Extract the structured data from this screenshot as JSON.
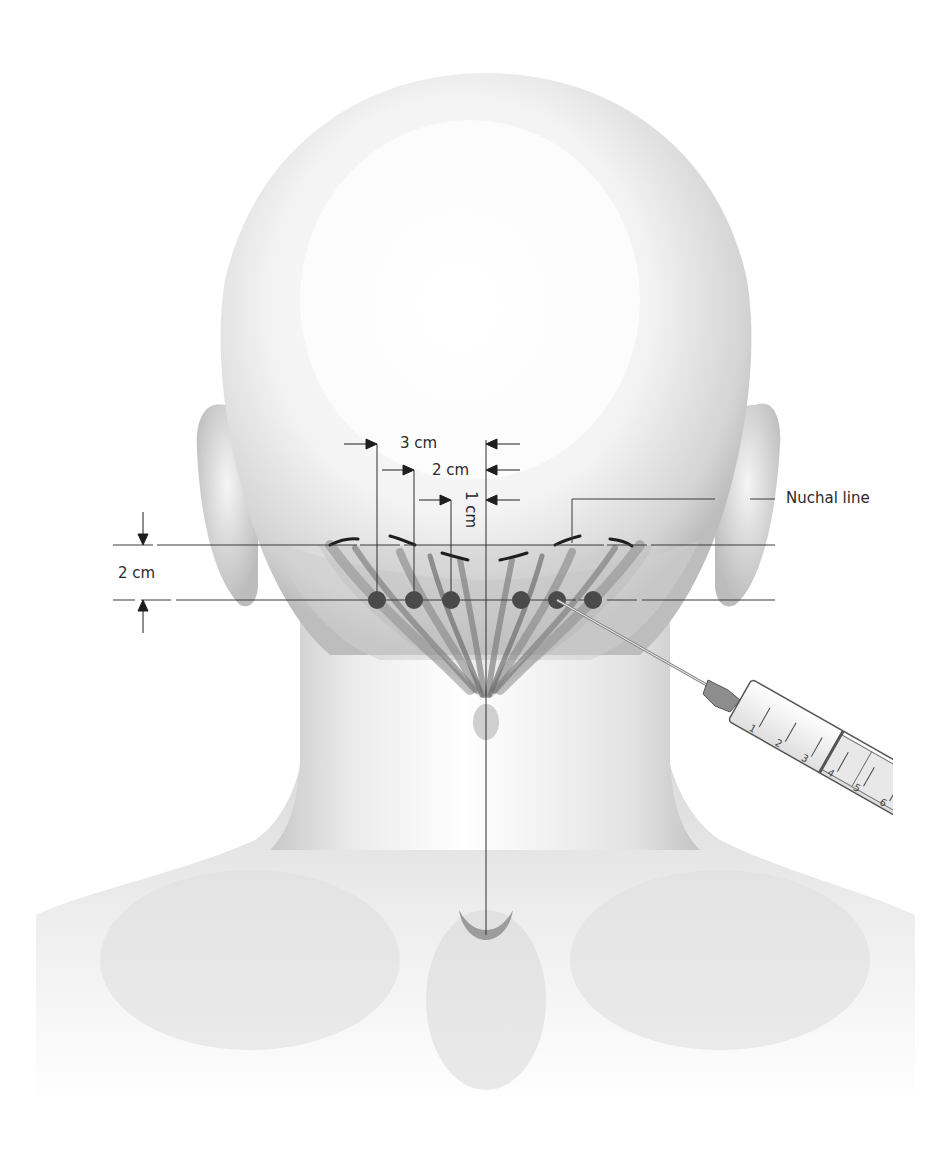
{
  "figure": {
    "labels": {
      "three_cm": "3 cm",
      "two_cm": "2 cm",
      "one_cm": "1 cm",
      "vertical_two_cm": "2 cm",
      "nuchal_line": "Nuchal line"
    },
    "injection_points": [
      {
        "side": "left",
        "offset_cm": 3
      },
      {
        "side": "left",
        "offset_cm": 2
      },
      {
        "side": "left",
        "offset_cm": 1
      },
      {
        "side": "right",
        "offset_cm": 1
      },
      {
        "side": "right",
        "offset_cm": 2
      },
      {
        "side": "right",
        "offset_cm": 3
      }
    ],
    "syringe": {
      "scale_marks": [
        "1",
        "2",
        "3",
        "4",
        "5",
        "6"
      ]
    },
    "colors": {
      "background": "#ffffff",
      "skin_light": "#f4f4f4",
      "skin_shadow": "#b8b8b8",
      "muscle": "#6e6e6e",
      "injection_dot": "#4a4a4a",
      "line": "#3a3a3a",
      "text": "#2a2a2a"
    }
  }
}
